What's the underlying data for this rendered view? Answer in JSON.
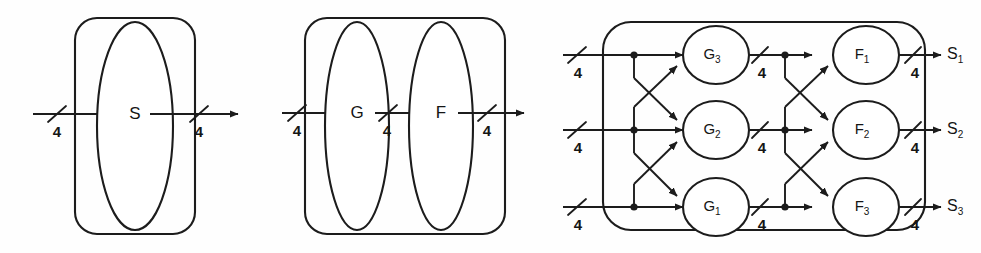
{
  "figure": {
    "name": "system-decomposition-diagram",
    "ink_color": "#1c1c1c",
    "background_color": "#fefefe"
  },
  "panels": [
    {
      "id": "panel-s",
      "name": "single-block-panel",
      "blocks": [
        {
          "id": "S",
          "label": "S",
          "subscript": ""
        }
      ],
      "input_bus_labels": [
        "4"
      ],
      "output_bus_labels": [
        "4"
      ]
    },
    {
      "id": "panel-gf",
      "name": "cascade-panel",
      "blocks": [
        {
          "id": "G",
          "label": "G",
          "subscript": ""
        },
        {
          "id": "F",
          "label": "F",
          "subscript": ""
        }
      ],
      "input_bus_labels": [
        "4"
      ],
      "internal_bus_labels": [
        "4"
      ],
      "output_bus_labels": [
        "4"
      ]
    },
    {
      "id": "panel-network",
      "name": "interconnect-network-panel",
      "stage_g": [
        {
          "id": "G3",
          "label": "G",
          "subscript": "3",
          "row": 0
        },
        {
          "id": "G2",
          "label": "G",
          "subscript": "2",
          "row": 1
        },
        {
          "id": "G1",
          "label": "G",
          "subscript": "1",
          "row": 2
        }
      ],
      "stage_f": [
        {
          "id": "F1",
          "label": "F",
          "subscript": "1",
          "row": 0
        },
        {
          "id": "F2",
          "label": "F",
          "subscript": "2",
          "row": 1
        },
        {
          "id": "F3",
          "label": "F",
          "subscript": "3",
          "row": 2
        }
      ],
      "input_bus_labels": [
        "4",
        "4",
        "4"
      ],
      "middle_bus_labels": [
        "4",
        "4",
        "4"
      ],
      "output_bus_labels": [
        "4",
        "4",
        "4"
      ],
      "outputs": [
        {
          "id": "S1",
          "label": "S",
          "subscript": "1"
        },
        {
          "id": "S2",
          "label": "S",
          "subscript": "2"
        },
        {
          "id": "S3",
          "label": "S",
          "subscript": "3"
        }
      ]
    }
  ]
}
